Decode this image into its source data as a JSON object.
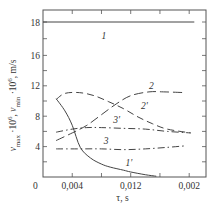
{
  "chart_data": {
    "type": "line",
    "title": "",
    "xlabel": "τ, s",
    "ylabel": {
      "parts": [
        {
          "text": "v",
          "style": "italic"
        },
        {
          "text": "max",
          "style": "sub"
        },
        {
          "text": " ·10",
          "style": "normal"
        },
        {
          "text": "6",
          "style": "sup"
        },
        {
          "text": ", ",
          "style": "normal"
        },
        {
          "text": "v",
          "style": "italic"
        },
        {
          "text": "min",
          "style": "sub"
        },
        {
          "text": " ·10",
          "style": "normal"
        },
        {
          "text": "6",
          "style": "sup"
        },
        {
          "text": ", m/s",
          "style": "normal"
        }
      ]
    },
    "xlim": [
      0,
      0.0223
    ],
    "ylim": [
      0,
      18
    ],
    "grid": false,
    "origin_label": "0",
    "x_ticks": [
      {
        "value": 0.004,
        "label": "0,004"
      },
      {
        "value": 0.008,
        "label": ""
      },
      {
        "value": 0.012,
        "label": "0,012"
      },
      {
        "value": 0.016,
        "label": ""
      },
      {
        "value": 0.02,
        "label": "0,002"
      }
    ],
    "y_ticks": [
      {
        "value": 2,
        "label": ""
      },
      {
        "value": 4,
        "label": "4"
      },
      {
        "value": 6,
        "label": ""
      },
      {
        "value": 8,
        "label": "8"
      },
      {
        "value": 10,
        "label": ""
      },
      {
        "value": 12,
        "label": "12"
      },
      {
        "value": 14,
        "label": ""
      },
      {
        "value": 16,
        "label": "16"
      },
      {
        "value": 17,
        "label": ""
      },
      {
        "value": 18,
        "label": "18"
      }
    ],
    "series": [
      {
        "name": "1",
        "style": "solid",
        "x": [
          0.0,
          0.0207
        ],
        "y": [
          18.0,
          18.0
        ],
        "label_at": [
          0.008,
          17.0
        ]
      },
      {
        "name": "1'",
        "style": "solid",
        "x": [
          0.0018,
          0.003,
          0.004,
          0.0051,
          0.0065,
          0.008,
          0.0092,
          0.011,
          0.012,
          0.014,
          0.0155
        ],
        "y": [
          10.3,
          8.7,
          6.8,
          3.9,
          2.5,
          1.7,
          1.3,
          0.9,
          0.66,
          0.3,
          0.1
        ],
        "label_at": [
          0.0113,
          1.4
        ]
      },
      {
        "name": "2",
        "style": "longdash",
        "x": [
          0.0018,
          0.004,
          0.006,
          0.008,
          0.01,
          0.012,
          0.0145,
          0.0165,
          0.0195
        ],
        "y": [
          4.8,
          5.8,
          6.8,
          8.2,
          9.6,
          10.7,
          11.2,
          11.2,
          11.1
        ],
        "label_at": [
          0.0145,
          11.6
        ]
      },
      {
        "name": "2'",
        "style": "dash",
        "x": [
          0.0018,
          0.003,
          0.005,
          0.007,
          0.009,
          0.011,
          0.013,
          0.015,
          0.017,
          0.0202
        ],
        "y": [
          10.2,
          11.0,
          11.1,
          10.7,
          9.9,
          9.0,
          7.9,
          7.0,
          6.3,
          5.8
        ],
        "label_at": [
          0.0134,
          8.9
        ]
      },
      {
        "name": "3'",
        "style": "dashdot",
        "x": [
          0.0018,
          0.004,
          0.006,
          0.008,
          0.011,
          0.014,
          0.017,
          0.0202
        ],
        "y": [
          5.9,
          6.3,
          6.5,
          6.5,
          6.4,
          6.3,
          6.0,
          5.8
        ],
        "label_at": [
          0.0096,
          7.1
        ]
      },
      {
        "name": "3",
        "style": "dashdot",
        "x": [
          0.0018,
          0.005,
          0.008,
          0.011,
          0.014,
          0.017,
          0.0195
        ],
        "y": [
          3.7,
          3.7,
          3.7,
          3.6,
          3.7,
          3.9,
          4.1
        ],
        "label_at": [
          0.0083,
          4.3
        ]
      }
    ]
  }
}
